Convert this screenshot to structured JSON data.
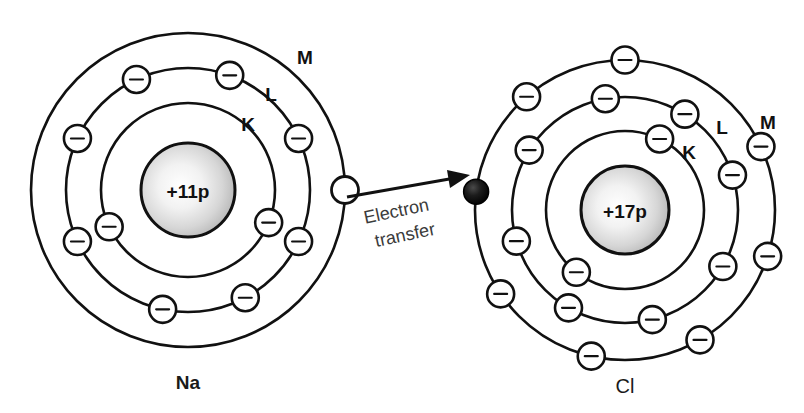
{
  "diagram": {
    "background_color": "#ffffff",
    "stroke_color": "#111111"
  },
  "transfer": {
    "label_line1": "Electron",
    "label_line2": "transfer",
    "label_color": "#3b3b3b",
    "arrow_from": "Na M-shell electron",
    "arrow_to": "Cl M-shell filled electron",
    "arrow_rotation_deg": -12
  },
  "atoms": [
    {
      "id": "sodium",
      "symbol": "Na",
      "nucleus_label": "+11p",
      "proton_count": 11,
      "center": {
        "x": 188,
        "y": 190
      },
      "nucleus_radius": 47,
      "label_font_weight": "bold",
      "shells": [
        {
          "name": "K",
          "radius": 87,
          "label_x": 248,
          "label_y": 124,
          "electron_count": 2,
          "electron_angles_deg": [
            205,
            338
          ]
        },
        {
          "name": "L",
          "radius": 122,
          "label_x": 271,
          "label_y": 94,
          "electron_count": 8,
          "electron_angles_deg": [
            258,
            205,
            155,
            115,
            70,
            25,
            335,
            298
          ]
        },
        {
          "name": "M",
          "radius": 157,
          "label_x": 305,
          "label_y": 57,
          "electron_count": 1,
          "electron_angles_deg": [
            0
          ],
          "electron_style": "empty",
          "note": "outer electron drawn as empty circle, being donated"
        }
      ]
    },
    {
      "id": "chlorine",
      "symbol": "Cl",
      "nucleus_label": "+17p",
      "proton_count": 17,
      "center": {
        "x": 625,
        "y": 210
      },
      "nucleus_radius": 44,
      "label_font_weight": "normal",
      "shells": [
        {
          "name": "K",
          "radius": 79,
          "label_x": 689,
          "label_y": 152,
          "electron_count": 2,
          "electron_angles_deg": [
            64,
            232
          ]
        },
        {
          "name": "L",
          "radius": 113,
          "label_x": 722,
          "label_y": 127,
          "electron_count": 8,
          "electron_angles_deg": [
            100,
            148,
            196,
            240,
            284,
            330,
            18,
            58
          ]
        },
        {
          "name": "M",
          "radius": 150,
          "label_x": 768,
          "label_y": 122,
          "electron_count": 8,
          "electron_angles_deg": [
            90,
            131,
            173,
            214,
            257,
            300,
            342,
            25
          ],
          "filled_index": 2,
          "note": "one electron drawn solid black: the electron received from Na"
        }
      ]
    }
  ],
  "legend": {
    "shell_names": [
      "K",
      "L",
      "M"
    ],
    "electron_glyph": "minus-sign-in-circle"
  }
}
